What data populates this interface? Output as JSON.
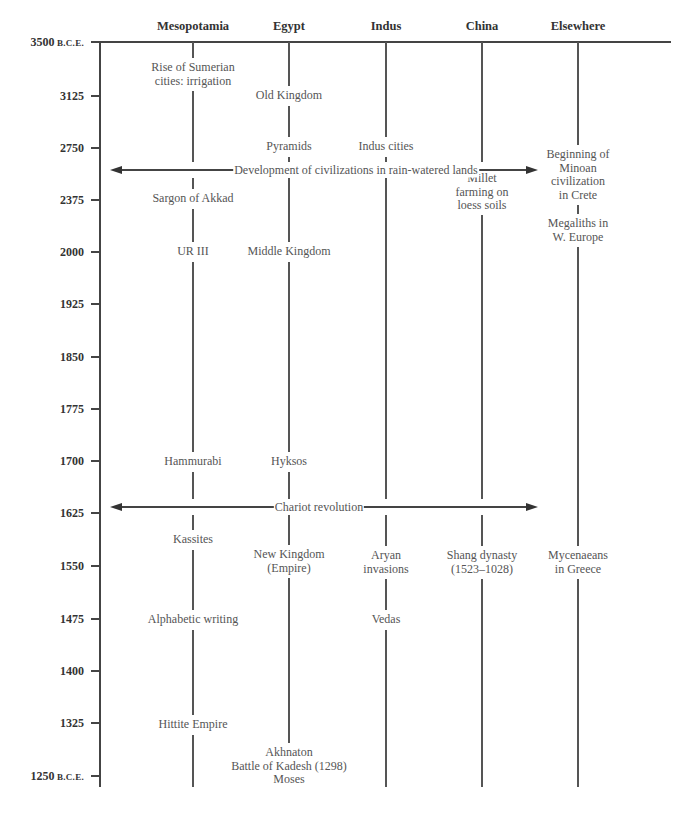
{
  "columns": [
    {
      "id": "mesopotamia",
      "label": "Mesopotamia",
      "x": 193
    },
    {
      "id": "egypt",
      "label": "Egypt",
      "x": 289
    },
    {
      "id": "indus",
      "label": "Indus",
      "x": 386
    },
    {
      "id": "china",
      "label": "China",
      "x": 482
    },
    {
      "id": "elsewhere",
      "label": "Elsewhere",
      "x": 578
    }
  ],
  "axis": {
    "ticks": [
      {
        "year": "3500",
        "suffix": "B.C.E.",
        "y": 42
      },
      {
        "year": "3125",
        "suffix": "",
        "y": 96
      },
      {
        "year": "2750",
        "suffix": "",
        "y": 148
      },
      {
        "year": "2375",
        "suffix": "",
        "y": 200
      },
      {
        "year": "2000",
        "suffix": "",
        "y": 252
      },
      {
        "year": "1925",
        "suffix": "",
        "y": 304
      },
      {
        "year": "1850",
        "suffix": "",
        "y": 357
      },
      {
        "year": "1775",
        "suffix": "",
        "y": 409
      },
      {
        "year": "1700",
        "suffix": "",
        "y": 461
      },
      {
        "year": "1625",
        "suffix": "",
        "y": 513
      },
      {
        "year": "1550",
        "suffix": "",
        "y": 566
      },
      {
        "year": "1475",
        "suffix": "",
        "y": 619
      },
      {
        "year": "1400",
        "suffix": "",
        "y": 671
      },
      {
        "year": "1325",
        "suffix": "",
        "y": 723
      },
      {
        "year": "1250",
        "suffix": "B.C.E.",
        "y": 776
      }
    ]
  },
  "events": {
    "mesopotamia": [
      {
        "text": "Rise of Sumerian\ncities: irrigation",
        "y": 74
      },
      {
        "text": "Sargon of Akkad",
        "y": 199
      },
      {
        "text": "UR III",
        "y": 252
      },
      {
        "text": "Hammurabi",
        "y": 462
      },
      {
        "text": "Kassites",
        "y": 540
      },
      {
        "text": "Alphabetic writing",
        "y": 620
      },
      {
        "text": "Hittite Empire",
        "y": 725
      }
    ],
    "egypt": [
      {
        "text": "Old Kingdom",
        "y": 96
      },
      {
        "text": "Pyramids",
        "y": 147
      },
      {
        "text": "Middle Kingdom",
        "y": 252
      },
      {
        "text": "Hyksos",
        "y": 462
      },
      {
        "text": "New Kingdom\n(Empire)",
        "y": 561
      },
      {
        "text": "Akhnaton\nBattle of Kadesh (1298)\nMoses",
        "y": 766
      }
    ],
    "indus": [
      {
        "text": "Indus cities",
        "y": 147
      },
      {
        "text": "Aryan\ninvasions",
        "y": 562
      },
      {
        "text": "Vedas",
        "y": 620
      }
    ],
    "china": [
      {
        "text": "Millet\nfarming on\nloess soils",
        "y": 192
      },
      {
        "text": "Shang dynasty\n(1523–1028)",
        "y": 562
      }
    ],
    "elsewhere": [
      {
        "text": "Beginning of\nMinoan\ncivilization\nin Crete",
        "y": 175
      },
      {
        "text": "Megaliths in\nW. Europe",
        "y": 230
      },
      {
        "text": "Mycenaeans\nin Greece",
        "y": 562
      }
    ]
  },
  "spanning_events": [
    {
      "label": "Development of civilizations in rain-watered lands",
      "y": 170,
      "x_start": 110,
      "x_end": 538,
      "label_x": 356
    },
    {
      "label": "Chariot revolution",
      "y": 507,
      "x_start": 110,
      "x_end": 538,
      "label_x": 319
    }
  ]
}
